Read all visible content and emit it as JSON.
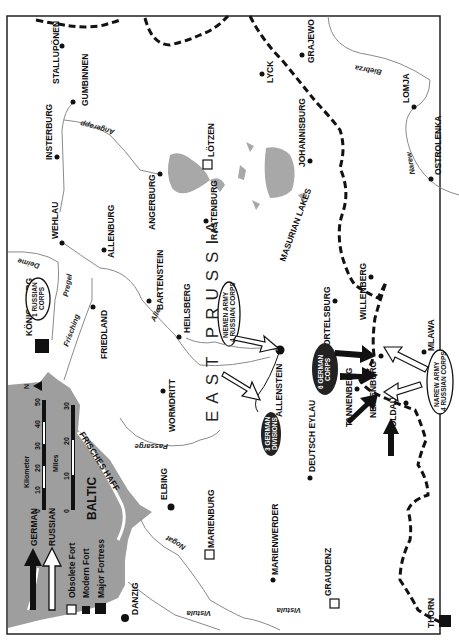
{
  "map": {
    "region_title": "EAST PRUSSIA",
    "sea_label": "BALTIC",
    "lagoon_label": "FRISCHES HAFF",
    "lakes_label": "MASURIAN LAKES",
    "north_label": "N",
    "orientation": "rotated 90° counter-clockwise"
  },
  "legend": {
    "german_label": "GERMAN",
    "russian_label": "RUSSIAN",
    "obsolete_fort_label": "Obsolete Fort",
    "modern_fort_label": "Modern Fort",
    "major_fortress_label": "Major Fortress"
  },
  "scale": {
    "km_label": "Kilometer",
    "km_ticks": [
      "0",
      "10",
      "20",
      "30",
      "40",
      "50"
    ],
    "miles_label": "Miles",
    "miles_ticks": [
      "0",
      "10",
      "20",
      "30"
    ]
  },
  "towns": [
    {
      "name": "STALLUPÖNEN",
      "type": "town"
    },
    {
      "name": "GUMBINNEN",
      "type": "town"
    },
    {
      "name": "INSTERBURG",
      "type": "town"
    },
    {
      "name": "WEHLAU",
      "type": "town"
    },
    {
      "name": "ALLENBURG",
      "type": "town"
    },
    {
      "name": "ANGERBURG",
      "type": "town"
    },
    {
      "name": "LÖTZEN",
      "type": "obsolete-fort"
    },
    {
      "name": "RASTENBURG",
      "type": "town"
    },
    {
      "name": "LYCK",
      "type": "town"
    },
    {
      "name": "GRAJEWO",
      "type": "town"
    },
    {
      "name": "JOHANNISBURG",
      "type": "town"
    },
    {
      "name": "LOMJA",
      "type": "town"
    },
    {
      "name": "OSTROLENKA",
      "type": "town"
    },
    {
      "name": "KÖNIGSBERG",
      "type": "major-fortress"
    },
    {
      "name": "FRIEDLAND",
      "type": "town"
    },
    {
      "name": "BARTENSTEIN",
      "type": "town"
    },
    {
      "name": "HEILSBERG",
      "type": "town"
    },
    {
      "name": "WORMDRITT",
      "type": "town"
    },
    {
      "name": "ALLENSTEIN",
      "type": "town"
    },
    {
      "name": "ORTELSBURG",
      "type": "town"
    },
    {
      "name": "WILLENBERG",
      "type": "town"
    },
    {
      "name": "NEIDENBURG",
      "type": "town"
    },
    {
      "name": "TANNENBERG",
      "type": "town"
    },
    {
      "name": "SOLDAU",
      "type": "town"
    },
    {
      "name": "MLAWA",
      "type": "town"
    },
    {
      "name": "DEUTSCH EYLAU",
      "type": "town"
    },
    {
      "name": "ELBING",
      "type": "town"
    },
    {
      "name": "MARIENBURG",
      "type": "obsolete-fort"
    },
    {
      "name": "MARIENWERDER",
      "type": "town"
    },
    {
      "name": "GRAUDENZ",
      "type": "obsolete-fort"
    },
    {
      "name": "DANZIG",
      "type": "town"
    },
    {
      "name": "THORN",
      "type": "major-fortress"
    }
  ],
  "rivers": [
    "Angerapp",
    "Deime",
    "Pregel",
    "Frisching",
    "Alle",
    "Passarge",
    "Nogat",
    "Vistula",
    "Biebrza",
    "Narew"
  ],
  "units": {
    "russian_1": "1 RUSSIAN CORPS",
    "niemen_army": "NIEMEN ARMY 4 RUSSIAN CORPS",
    "german_3div": "3 GERMAN DIVISIONS",
    "german_6corps": "6 GERMAN CORPS",
    "narew_army": "NAREW ARMY 4 RUSSIAN CORPS"
  },
  "colors": {
    "sea": "#9a9a9a",
    "lakes": "#a8a8a8",
    "river": "#8a8a8a",
    "border": "#111111",
    "frame": "#222222"
  }
}
